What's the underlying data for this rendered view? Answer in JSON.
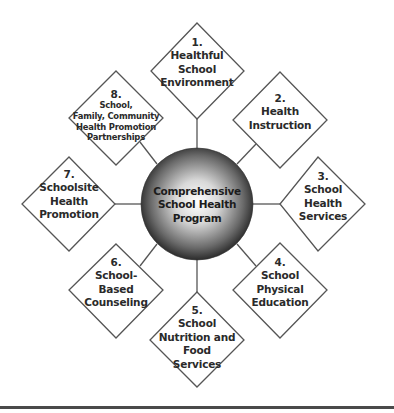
{
  "hub": {
    "lines": [
      "Comprehensive",
      "School Health",
      "Program"
    ],
    "gradient_center": "#ffffff",
    "gradient_edge": "#1a1a1a"
  },
  "components": [
    {
      "number": "1.",
      "lines": [
        "Healthful",
        "School",
        "Environment"
      ]
    },
    {
      "number": "2.",
      "lines": [
        "Health",
        "Instruction"
      ]
    },
    {
      "number": "3.",
      "lines": [
        "School",
        "Health",
        "Services"
      ]
    },
    {
      "number": "4.",
      "lines": [
        "School",
        "Physical",
        "Education"
      ]
    },
    {
      "number": "5.",
      "lines": [
        "School",
        "Nutrition and",
        "Food",
        "Services"
      ]
    },
    {
      "number": "6.",
      "lines": [
        "School-",
        "Based",
        "Counseling"
      ]
    },
    {
      "number": "7.",
      "lines": [
        "Schoolsite",
        "Health",
        "Promotion"
      ]
    },
    {
      "number": "8.",
      "lines": [
        "School,",
        "Family, Community",
        "Health Promotion",
        "Partnerships"
      ]
    }
  ]
}
